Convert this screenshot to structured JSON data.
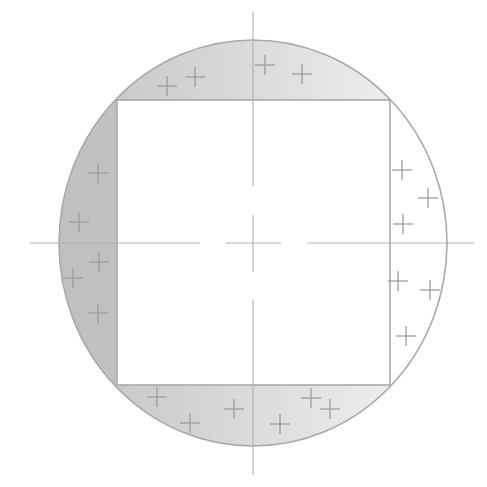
{
  "diagram": {
    "title": "",
    "width": 487,
    "height": 487,
    "colors": {
      "background": "#ffffff",
      "outline": "#a9a9a9",
      "axis": "#b4b4b4",
      "marker": "#9c9c9c",
      "left_fill": "#c0c0c0",
      "gradient_dark": "#c2c2c2",
      "gradient_light": "#f4f4f4",
      "right_fill": "#ffffff"
    },
    "circle": {
      "cx": 253,
      "cy": 243,
      "rx": 194,
      "ry": 203
    },
    "square": {
      "x": 117,
      "y": 100,
      "width": 273,
      "height": 285
    },
    "axes": {
      "vertical_segments": [
        [
          12,
          186
        ],
        [
          215,
          272
        ],
        [
          300,
          475
        ]
      ],
      "horizontal_segments": [
        [
          30,
          200
        ],
        [
          226,
          281
        ],
        [
          307,
          474
        ]
      ]
    },
    "regions": [
      {
        "name": "top-segment",
        "fill": "gradient",
        "markers": [
          [
            167,
            86
          ],
          [
            195,
            77
          ],
          [
            265,
            65
          ],
          [
            302,
            74
          ]
        ]
      },
      {
        "name": "left-segment",
        "fill": "solid-dark",
        "markers": [
          [
            98,
            173
          ],
          [
            79,
            222
          ],
          [
            99,
            262
          ],
          [
            73,
            278
          ],
          [
            98,
            313
          ]
        ]
      },
      {
        "name": "right-segment",
        "fill": "white",
        "markers": [
          [
            402,
            170
          ],
          [
            428,
            198
          ],
          [
            403,
            224
          ],
          [
            398,
            281
          ],
          [
            430,
            290
          ],
          [
            406,
            336
          ]
        ]
      },
      {
        "name": "bottom-segment",
        "fill": "gradient",
        "markers": [
          [
            157,
            397
          ],
          [
            190,
            423
          ],
          [
            234,
            409
          ],
          [
            280,
            424
          ],
          [
            311,
            398
          ],
          [
            330,
            409
          ]
        ]
      }
    ],
    "marker_size": 10
  }
}
